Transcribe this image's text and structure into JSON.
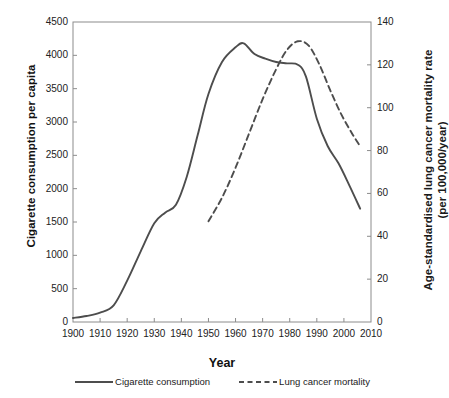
{
  "chart_data": {
    "type": "line",
    "title": "",
    "xlabel": "Year",
    "ylabel": "Cigarette consumption per capita",
    "ylabel_right_line1": "Age-standardised lung cancer mortality rate",
    "ylabel_right_line2": "(per 100,000/year)",
    "xlim": [
      1900,
      2010
    ],
    "ylim": [
      0,
      4500
    ],
    "ylim_right": [
      0,
      140
    ],
    "grid": false,
    "legend_position": "bottom",
    "xticks": [
      1900,
      1910,
      1920,
      1930,
      1940,
      1950,
      1960,
      1970,
      1980,
      1990,
      2000,
      2010
    ],
    "yticks_left": [
      0,
      500,
      1000,
      1500,
      2000,
      2500,
      3000,
      3500,
      4000,
      4500
    ],
    "yticks_right": [
      0,
      20,
      40,
      60,
      80,
      100,
      120,
      140
    ],
    "series": [
      {
        "name": "Cigarette consumption",
        "axis": "left",
        "style": "solid",
        "color": "#4d4d4d",
        "x": [
          1900,
          1905,
          1910,
          1915,
          1920,
          1925,
          1930,
          1934,
          1938,
          1942,
          1946,
          1950,
          1955,
          1960,
          1963,
          1967,
          1971,
          1975,
          1979,
          1983,
          1986,
          1990,
          1994,
          1998,
          2002,
          2006
        ],
        "y": [
          60,
          90,
          140,
          250,
          620,
          1060,
          1480,
          1640,
          1760,
          2180,
          2800,
          3420,
          3900,
          4120,
          4180,
          4020,
          3950,
          3900,
          3880,
          3860,
          3680,
          3050,
          2640,
          2380,
          2050,
          1700
        ]
      },
      {
        "name": "Lung cancer mortality",
        "axis": "right",
        "style": "dashed",
        "color": "#4d4d4d",
        "x": [
          1950,
          1955,
          1960,
          1965,
          1970,
          1975,
          1979,
          1983,
          1987,
          1991,
          1995,
          1999,
          2003,
          2006
        ],
        "y": [
          47,
          58,
          72,
          88,
          104,
          118,
          127,
          131,
          129,
          120,
          108,
          97,
          88,
          82
        ]
      }
    ]
  },
  "legend": {
    "items": [
      {
        "label": "Cigarette consumption",
        "style": "solid"
      },
      {
        "label": "Lung cancer mortality",
        "style": "dashed"
      }
    ]
  }
}
